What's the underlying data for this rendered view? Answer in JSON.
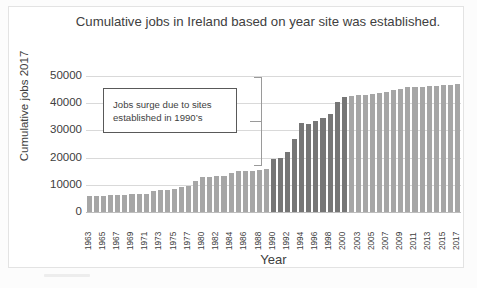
{
  "figure": {
    "title": "Cumulative jobs in Ireland  based on year site was established.",
    "annotation": {
      "line1": "Jobs surge due to sites",
      "line2": "established in 1990’s"
    },
    "colors": {
      "bar_light": "#a6a6a6",
      "bar_dark": "#767676",
      "gridline": "#d9d9d9",
      "text": "#404040",
      "annotation_border": "#595959"
    }
  },
  "chart_data": {
    "type": "bar",
    "title": "Cumulative jobs in Ireland  based on year site was established.",
    "xlabel": "Year",
    "ylabel": "Cumulative jobs 2017",
    "ylim": [
      0,
      50000
    ],
    "ytick_labels": [
      "50000",
      "40000",
      "30000",
      "20000",
      "10000",
      "0"
    ],
    "ytick_values": [
      50000,
      40000,
      30000,
      20000,
      10000,
      0
    ],
    "grid": true,
    "legend": "none",
    "xtick_labels": [
      "1963",
      "1965",
      "1967",
      "1969",
      "1971",
      "1973",
      "1975",
      "1977",
      "1980",
      "1982",
      "1984",
      "1986",
      "1988",
      "1990",
      "1992",
      "1994",
      "1996",
      "1998",
      "2000",
      "2003",
      "2005",
      "2007",
      "2009",
      "2011",
      "2013",
      "2015",
      "2017"
    ],
    "annotations": [
      {
        "text": "Jobs surge due to sites established in 1990’s",
        "type": "text-box-with-brace",
        "brace_range": [
          16000,
          50000
        ]
      }
    ],
    "categories": [
      "1963",
      "1964",
      "1965",
      "1966",
      "1967",
      "1968",
      "1969",
      "1970",
      "1971",
      "1972",
      "1973",
      "1974",
      "1975",
      "1976",
      "1977",
      "1978",
      "1980",
      "1981",
      "1982",
      "1983",
      "1984",
      "1985",
      "1986",
      "1987",
      "1988",
      "1989",
      "1990",
      "1991",
      "1992",
      "1993",
      "1994",
      "1995",
      "1996",
      "1997",
      "1998",
      "1999",
      "2000",
      "2001",
      "2003",
      "2004",
      "2005",
      "2006",
      "2007",
      "2008",
      "2009",
      "2010",
      "2011",
      "2012",
      "2013",
      "2014",
      "2015",
      "2016",
      "2017"
    ],
    "values": [
      5900,
      5800,
      5900,
      6200,
      6300,
      6300,
      6600,
      6700,
      6800,
      7600,
      8000,
      8200,
      8400,
      9100,
      9700,
      11400,
      13000,
      13000,
      13100,
      13100,
      14300,
      15200,
      15200,
      15200,
      15300,
      15700,
      19400,
      19700,
      22200,
      26800,
      32700,
      32500,
      33400,
      34700,
      36200,
      40300,
      42300,
      42800,
      43100,
      43200,
      43300,
      43700,
      44200,
      44800,
      45400,
      45900,
      46000,
      46100,
      46500,
      46500,
      46600,
      46600,
      47000
    ],
    "series_segments": [
      {
        "name": "pre-1990 sites",
        "color": "#a6a6a6",
        "from": "1963",
        "to": "1989"
      },
      {
        "name": "1990s surge sites",
        "color": "#767676",
        "from": "1990",
        "to": "2000"
      },
      {
        "name": "post-2000 sites",
        "color": "#a6a6a6",
        "from": "2001",
        "to": "2017"
      }
    ]
  }
}
